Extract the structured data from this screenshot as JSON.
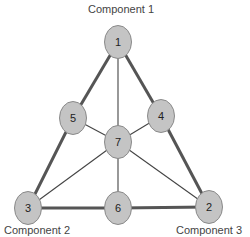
{
  "diagram": {
    "component_labels": [
      {
        "id": "c1",
        "text": "Component 1",
        "x": 88,
        "y": 3
      },
      {
        "id": "c2",
        "text": "Component 2",
        "x": 4,
        "y": 224
      },
      {
        "id": "c3",
        "text": "Component 3",
        "x": 184,
        "y": 224
      }
    ],
    "nodes": [
      {
        "id": "1",
        "label": "1",
        "cx": 118,
        "cy": 42
      },
      {
        "id": "2",
        "label": "2",
        "cx": 209,
        "cy": 207
      },
      {
        "id": "3",
        "label": "3",
        "cx": 28,
        "cy": 208
      },
      {
        "id": "4",
        "label": "4",
        "cx": 161,
        "cy": 116
      },
      {
        "id": "5",
        "label": "5",
        "cx": 73,
        "cy": 118
      },
      {
        "id": "6",
        "label": "6",
        "cx": 118,
        "cy": 208
      },
      {
        "id": "7",
        "label": "7",
        "cx": 118,
        "cy": 142
      }
    ],
    "edges": [
      {
        "from": "1",
        "to": "5",
        "weight": "thick"
      },
      {
        "from": "5",
        "to": "3",
        "weight": "thick"
      },
      {
        "from": "1",
        "to": "4",
        "weight": "thick"
      },
      {
        "from": "4",
        "to": "2",
        "weight": "thick"
      },
      {
        "from": "3",
        "to": "6",
        "weight": "thick"
      },
      {
        "from": "6",
        "to": "2",
        "weight": "thick"
      },
      {
        "from": "1",
        "to": "7",
        "weight": "thin"
      },
      {
        "from": "5",
        "to": "7",
        "weight": "thin"
      },
      {
        "from": "4",
        "to": "7",
        "weight": "thin"
      },
      {
        "from": "3",
        "to": "7",
        "weight": "thin"
      },
      {
        "from": "2",
        "to": "7",
        "weight": "thin"
      },
      {
        "from": "6",
        "to": "7",
        "weight": "thin"
      }
    ],
    "colors": {
      "node_fill": "#c4c4c4",
      "node_stroke": "#8a8a8a",
      "thick_edge": "#555555",
      "thin_edge": "#444444",
      "label_text": "#444444"
    }
  }
}
